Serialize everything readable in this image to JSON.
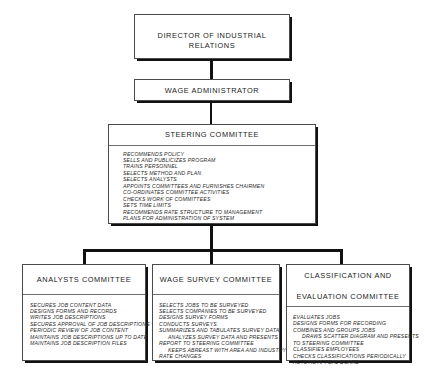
{
  "diagram": {
    "type": "organizational-hierarchy",
    "nodes": {
      "director": {
        "title": "DIRECTOR OF INDUSTRIAL RELATIONS",
        "duties": []
      },
      "wage_administrator": {
        "title": "WAGE ADMINISTRATOR",
        "duties": []
      },
      "steering_committee": {
        "title": "STEERING COMMITTEE",
        "duties": [
          "RECOMMENDS POLICY",
          "SELLS AND PUBLICIZES PROGRAM",
          "TRAINS PERSONNEL",
          "SELECTS METHOD AND PLAN",
          "SELECTS ANALYSTS",
          "APPOINTS COMMITTEES AND FURNISHES CHAIRMEN",
          "CO-ORDINATES COMMITTEE ACTIVITIES",
          "CHECKS WORK OF COMMITTEES",
          "SETS TIME LIMITS",
          "RECOMMENDS RATE STRUCTURE TO MANAGEMENT",
          "PLANS FOR ADMINISTRATION OF SYSTEM"
        ]
      },
      "analysts_committee": {
        "title": "ANALYSTS COMMITTEE",
        "duties": [
          "SECURES JOB CONTENT DATA",
          "DESIGNS FORMS AND RECORDS",
          "WRITES JOB DESCRIPTIONS",
          "SECURES APPROVAL OF JOB DESCRIPTIONS",
          "PERIODIC REVIEW OF JOB CONTENT",
          "MAINTAINS JOB DESCRIPTIONS UP TO DATE",
          "MAINTAINS JOB DESCRIPTION FILES"
        ]
      },
      "wage_survey_committee": {
        "title": "WAGE SURVEY COMMITTEE",
        "duties": [
          "SELECTS JOBS TO BE SURVEYED",
          "SELECTS COMPANIES TO BE SURVEYED",
          "DESIGNS SURVEY FORMS",
          "CONDUCTS SURVEYS",
          "SUMMARIZES AND TABULATES SURVEY DATA",
          "ANALYZES SURVEY DATA AND PRESENTS",
          "REPORT TO STEERING COMMITTEE",
          "KEEPS ABREAST WITH AREA AND INDUSTRY",
          "RATE CHANGES"
        ],
        "indented_lines": [
          6,
          8
        ]
      },
      "classification_committee": {
        "title_line1": "CLASSIFICATION AND",
        "title_line2": "EVALUATION COMMITTEE",
        "duties": [
          "EVALUATES JOBS",
          "DESIGNS FORMS FOR RECORDING",
          "COMBINES AND GROUPS JOBS",
          "DRAWS SCATTER DIAGRAM AND PRESENTS",
          "TO STEERING COMMITTEE",
          "CLASSIFIES EMPLOYEES",
          "CHECKS CLASSIFICATIONS PERIODICALLY",
          "ACTS AS APPEAL BOARD"
        ],
        "indented_lines": [
          4
        ]
      }
    },
    "edges": [
      {
        "from": "director",
        "to": "wage_administrator"
      },
      {
        "from": "wage_administrator",
        "to": "steering_committee"
      },
      {
        "from": "steering_committee",
        "to": "analysts_committee"
      },
      {
        "from": "steering_committee",
        "to": "wage_survey_committee"
      },
      {
        "from": "steering_committee",
        "to": "classification_committee"
      }
    ],
    "colors": {
      "background": "#ffffff",
      "box_border": "#4a4a4a",
      "shadow": "#111111",
      "text": "#1a1a1a"
    }
  }
}
